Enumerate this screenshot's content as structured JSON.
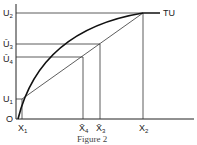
{
  "figure": {
    "caption": "Figure 2",
    "curve_label": "TU",
    "origin_label": "O",
    "y_labels": {
      "u2": "U",
      "u2_sub": "2",
      "u3": "Ū",
      "u3_sub": "3",
      "u4": "Ū",
      "u4_sub": "4",
      "u1": "U",
      "u1_sub": "1"
    },
    "x_labels": {
      "x1": "X",
      "x1_sub": "1",
      "x4": "X̄",
      "x4_sub": "4",
      "x3": "X̄",
      "x3_sub": "3",
      "x2": "X",
      "x2_sub": "2"
    },
    "colors": {
      "line": "#222222",
      "background": "#ffffff"
    }
  }
}
